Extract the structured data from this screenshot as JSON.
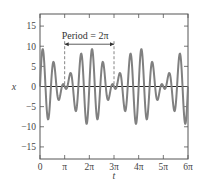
{
  "chart_data": {
    "type": "line",
    "title": "",
    "xlabel": "t",
    "ylabel": "x",
    "xlim": [
      0,
      6
    ],
    "xlim_units": "pi",
    "ylim": [
      -18,
      18
    ],
    "x_ticks": [
      {
        "value": 0,
        "label": "0"
      },
      {
        "value": 1,
        "label": "π"
      },
      {
        "value": 2,
        "label": "2π"
      },
      {
        "value": 3,
        "label": "3π"
      },
      {
        "value": 4,
        "label": "4π"
      },
      {
        "value": 5,
        "label": "5π"
      },
      {
        "value": 6,
        "label": "6π"
      }
    ],
    "y_ticks": [
      {
        "value": 15,
        "label": "15"
      },
      {
        "value": 10,
        "label": "10"
      },
      {
        "value": 5,
        "label": "5"
      },
      {
        "value": 0,
        "label": "0"
      },
      {
        "value": -5,
        "label": "−5"
      },
      {
        "value": -10,
        "label": "−10"
      },
      {
        "value": -15,
        "label": "−15"
      }
    ],
    "grid": false,
    "legend": null,
    "series": [
      {
        "name": "x(t)",
        "color": "#808080",
        "description": "periodic signal, period 2π, max ≈ 9.4, min ≈ −9.4, secondary lobes ≈ ±4.5",
        "model": {
          "terms": [
            {
              "amp": 4.7,
              "freq": 4
            },
            {
              "amp": 4.7,
              "freq": 5
            }
          ]
        }
      }
    ],
    "annotations": [
      {
        "type": "period-marker",
        "text": "Period = 2π",
        "from": 1,
        "to": 3,
        "y_text": 12.5,
        "y_arrow": 10.5,
        "dashed_lines_at": [
          1,
          3
        ]
      }
    ],
    "zero_line": true
  }
}
